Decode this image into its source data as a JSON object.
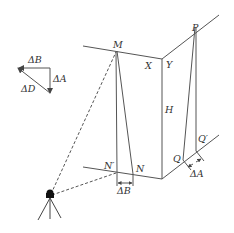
{
  "diagram": {
    "vector_triangle": {
      "labels": {
        "delta_b": "ΔB",
        "delta_a": "ΔA",
        "delta_d": "ΔD"
      }
    },
    "points": {
      "M": "M",
      "X": "X",
      "Y": "Y",
      "P": "P",
      "H": "H",
      "N_prime": "N′",
      "N": "N",
      "Q": "Q",
      "Q_prime": "Q′"
    },
    "offset_labels": {
      "bottom_left": "ΔB",
      "bottom_right": "ΔA"
    },
    "colors": {
      "line": "#555555",
      "text": "#333333",
      "background": "#ffffff"
    }
  }
}
